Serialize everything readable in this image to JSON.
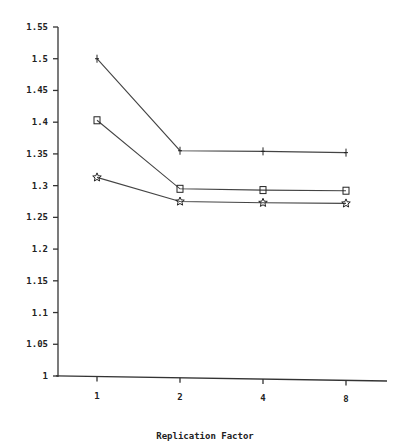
{
  "chart_data": {
    "type": "line",
    "title": "",
    "xlabel": "Replication Factor",
    "ylabel": "",
    "categories": [
      "1",
      "2",
      "4",
      "8"
    ],
    "ylim": [
      1,
      1.55
    ],
    "yticks": [
      "1",
      "1.05",
      "1.1",
      "1.15",
      "1.2",
      "1.25",
      "1.3",
      "1.35",
      "1.4",
      "1.45",
      "1.5",
      "1.55"
    ],
    "ytick_values": [
      1,
      1.05,
      1.1,
      1.15,
      1.2,
      1.25,
      1.3,
      1.35,
      1.4,
      1.45,
      1.5,
      1.55
    ],
    "grid": false,
    "legend": "none",
    "series": [
      {
        "name": "plus",
        "marker": "plus",
        "values": [
          1.5,
          1.355,
          1.354,
          1.352
        ]
      },
      {
        "name": "square",
        "marker": "square",
        "values": [
          1.403,
          1.295,
          1.293,
          1.292
        ]
      },
      {
        "name": "star",
        "marker": "star",
        "values": [
          1.313,
          1.275,
          1.273,
          1.272
        ]
      }
    ]
  }
}
